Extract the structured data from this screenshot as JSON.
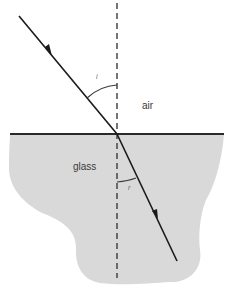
{
  "diagram": {
    "type": "refraction",
    "media": {
      "upper": {
        "label": "air",
        "color": "#ffffff"
      },
      "lower": {
        "label": "glass",
        "color": "#d9d9d9"
      }
    },
    "angles": {
      "incidence": {
        "label": "i"
      },
      "refraction": {
        "label": "r"
      }
    },
    "colors": {
      "ray": "#1a1a1a",
      "interface": "#2a2a2a",
      "normal": "#3a3a3a",
      "glass_fill": "#d9d9d9"
    }
  }
}
